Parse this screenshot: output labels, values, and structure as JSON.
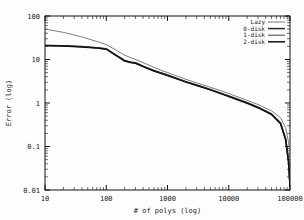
{
  "chart_data": {
    "type": "line",
    "title": "",
    "xlabel": "# of polys (log)",
    "ylabel": "Error (log)",
    "xscale": "log",
    "yscale": "log",
    "xlim": [
      10,
      100000
    ],
    "ylim": [
      0.01,
      100
    ],
    "xticks": [
      "10",
      "100",
      "1000",
      "10000",
      "100000"
    ],
    "yticks": [
      "0.01",
      "0.1",
      "1",
      "10",
      "100"
    ],
    "grid": false,
    "legend_position": "top-right",
    "series": [
      {
        "name": "Lazy",
        "color": "#6e6e6e",
        "width": 0.9,
        "x": [
          10,
          20,
          40,
          70,
          100,
          150,
          200,
          300,
          500,
          800,
          1000,
          2000,
          3000,
          5000,
          8000,
          10000,
          20000,
          30000,
          50000,
          70000,
          85000,
          95000,
          100000
        ],
        "y": [
          50,
          42,
          33,
          26,
          22,
          16,
          12.5,
          10.0,
          7.4,
          5.6,
          5.0,
          3.5,
          2.9,
          2.3,
          1.85,
          1.65,
          1.15,
          0.92,
          0.66,
          0.46,
          0.27,
          0.12,
          0.07
        ]
      },
      {
        "name": "0-disk",
        "color": "#2b2b2b",
        "width": 1.5,
        "x": [
          10,
          20,
          40,
          70,
          100,
          140,
          200,
          260,
          300,
          400,
          600,
          1000,
          2000,
          3000,
          5000,
          8000,
          10000,
          20000,
          30000,
          50000,
          70000,
          85000,
          95000,
          100000
        ],
        "y": [
          21,
          20.6,
          19.8,
          18.6,
          17.6,
          13.0,
          9.5,
          8.6,
          8.4,
          7.0,
          5.6,
          4.4,
          3.1,
          2.6,
          2.05,
          1.62,
          1.45,
          1.02,
          0.8,
          0.56,
          0.35,
          0.15,
          0.045,
          0.012
        ]
      },
      {
        "name": "1-disk",
        "color": "#555555",
        "width": 1.1,
        "x": [
          10,
          20,
          40,
          70,
          100,
          140,
          200,
          260,
          300,
          400,
          600,
          1000,
          2000,
          3000,
          5000,
          8000,
          10000,
          20000,
          30000,
          50000,
          70000,
          85000,
          95000,
          100000
        ],
        "y": [
          21,
          20.5,
          19.6,
          18.4,
          17.4,
          12.8,
          9.3,
          8.5,
          8.3,
          6.9,
          5.5,
          4.35,
          3.05,
          2.55,
          2.02,
          1.6,
          1.43,
          1.0,
          0.79,
          0.55,
          0.34,
          0.145,
          0.043,
          0.012
        ]
      },
      {
        "name": "2-disk",
        "color": "#111111",
        "width": 1.5,
        "x": [
          10,
          20,
          40,
          70,
          100,
          140,
          200,
          260,
          300,
          400,
          600,
          1000,
          2000,
          3000,
          5000,
          8000,
          10000,
          20000,
          30000,
          50000,
          70000,
          85000,
          95000,
          100000
        ],
        "y": [
          21,
          20.4,
          19.5,
          18.3,
          17.3,
          12.7,
          9.2,
          8.4,
          8.2,
          6.85,
          5.45,
          4.3,
          3.02,
          2.52,
          2.0,
          1.58,
          1.41,
          0.99,
          0.78,
          0.545,
          0.335,
          0.14,
          0.042,
          0.012
        ]
      }
    ]
  },
  "axes": {
    "xlabel": "# of polys (log)",
    "ylabel": "Error (log)"
  },
  "legend": {
    "entries": [
      {
        "label": "Lazy"
      },
      {
        "label": "0-disk"
      },
      {
        "label": "1-disk"
      },
      {
        "label": "2-disk"
      }
    ]
  },
  "style": {
    "frame_color": "#111111",
    "background": "#fdfdfd",
    "text_color": "#1a1a1a"
  }
}
